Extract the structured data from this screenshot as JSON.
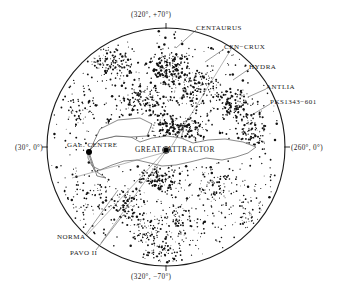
{
  "figure": {
    "type": "sky-map",
    "projection": "galactic-polar-disk",
    "background_color": "#ffffff",
    "point_color": "#111111",
    "outline_color": "#1a1a1a"
  },
  "axes": {
    "top_label": "(320°, +70°)",
    "bottom_label": "(320°, −70°)",
    "left_label": "(30°, 0°)",
    "right_label": "(260°, 0°)"
  },
  "features": {
    "centaurus": "CENTAURUS",
    "cen_crux": "CEN−CRUX",
    "hydra": "HYDRA",
    "antlia": "ANTLIA",
    "pks": "PKS1343−601",
    "gal_centre": "GAL. CENTRE",
    "great": "GREAT",
    "attractor": "ATTRACTOR",
    "norma": "NORMA",
    "pavo": "PAVO II"
  },
  "chart_data": {
    "type": "scatter",
    "title": "",
    "xlabel": "",
    "ylabel": "",
    "coordinate_system": "galactic",
    "disk": {
      "cx": 166,
      "cy": 147,
      "r": 119
    },
    "axis_ticks": [
      {
        "name": "top",
        "label": "(320°, +70°)",
        "x": 166,
        "y": 28
      },
      {
        "name": "bottom",
        "label": "(320°, −70°)",
        "x": 166,
        "y": 266
      },
      {
        "name": "left",
        "label": "(30°, 0°)",
        "x": 47,
        "y": 147
      },
      {
        "name": "right",
        "label": "(260°, 0°)",
        "x": 285,
        "y": 147
      }
    ],
    "marked_points": [
      {
        "name": "GAL. CENTRE",
        "x": 89,
        "y": 152,
        "size": 3.0
      },
      {
        "name": "PKS1343-601",
        "x": 166,
        "y": 150,
        "size": 2.6
      }
    ],
    "leader_lines": [
      {
        "name": "CENTAURUS",
        "x1": 196,
        "y1": 30,
        "x2": 176,
        "y2": 48
      },
      {
        "name": "CEN-CRUX",
        "x1": 224,
        "y1": 49,
        "x2": 205,
        "y2": 62
      },
      {
        "name": "HYDRA",
        "x1": 249,
        "y1": 69,
        "x2": 233,
        "y2": 80
      },
      {
        "name": "ANTLIA",
        "x1": 266,
        "y1": 89,
        "x2": 248,
        "y2": 97
      },
      {
        "name": "PKS1343-601",
        "x1": 270,
        "y1": 104,
        "x2": 250,
        "y2": 116
      },
      {
        "name": "NORMA",
        "x1": 86,
        "y1": 234,
        "x2": 118,
        "y2": 190
      },
      {
        "name": "PAVO II",
        "x1": 96,
        "y1": 250,
        "x2": 123,
        "y2": 215
      }
    ],
    "radial_lines": [
      {
        "name": "cen-crux-ray",
        "x1": 168,
        "y1": 152,
        "x2": 238,
        "y2": 38
      },
      {
        "name": "norma-ray",
        "x1": 166,
        "y1": 150,
        "x2": 86,
        "y2": 236
      },
      {
        "name": "pavo-ray",
        "x1": 166,
        "y1": 152,
        "x2": 101,
        "y2": 243
      },
      {
        "name": "gc-ray",
        "x1": 166,
        "y1": 152,
        "x2": 72,
        "y2": 178
      }
    ],
    "zone_of_avoidance": [
      [
        88,
        152
      ],
      [
        99,
        140
      ],
      [
        116,
        136
      ],
      [
        131,
        137
      ],
      [
        140,
        142
      ],
      [
        152,
        138
      ],
      [
        167,
        136
      ],
      [
        181,
        138
      ],
      [
        193,
        143
      ],
      [
        208,
        140
      ],
      [
        225,
        139
      ],
      [
        243,
        142
      ],
      [
        256,
        147
      ],
      [
        248,
        153
      ],
      [
        236,
        157
      ],
      [
        222,
        160
      ],
      [
        206,
        158
      ],
      [
        190,
        162
      ],
      [
        176,
        165
      ],
      [
        162,
        166
      ],
      [
        150,
        163
      ],
      [
        137,
        160
      ],
      [
        124,
        161
      ],
      [
        112,
        165
      ],
      [
        100,
        170
      ],
      [
        92,
        166
      ],
      [
        88,
        158
      ]
    ],
    "wedge_outline": [
      [
        89,
        152
      ],
      [
        100,
        129
      ],
      [
        118,
        120
      ],
      [
        140,
        118
      ],
      [
        152,
        124
      ],
      [
        147,
        136
      ],
      [
        131,
        137
      ],
      [
        116,
        136
      ],
      [
        99,
        140
      ],
      [
        88,
        152
      ],
      [
        94,
        170
      ],
      [
        106,
        178
      ],
      [
        97,
        176
      ]
    ],
    "cluster_seeds": [
      {
        "name": "centaurus-core",
        "cx": 168,
        "cy": 70,
        "rx": 24,
        "ry": 20,
        "n": 150,
        "size": 1.9
      },
      {
        "name": "centaurus-wing",
        "cx": 196,
        "cy": 86,
        "rx": 26,
        "ry": 22,
        "n": 130,
        "size": 1.8
      },
      {
        "name": "hydra-antlia",
        "cx": 232,
        "cy": 105,
        "rx": 24,
        "ry": 22,
        "n": 120,
        "size": 1.8
      },
      {
        "name": "great-attractor",
        "cx": 178,
        "cy": 128,
        "rx": 34,
        "ry": 16,
        "n": 175,
        "size": 1.9
      },
      {
        "name": "ga-south",
        "cx": 160,
        "cy": 178,
        "rx": 24,
        "ry": 14,
        "n": 110,
        "size": 1.8
      },
      {
        "name": "norma-filament",
        "cx": 127,
        "cy": 205,
        "rx": 20,
        "ry": 22,
        "n": 95,
        "size": 1.7
      },
      {
        "name": "pavo-filament",
        "cx": 148,
        "cy": 230,
        "rx": 20,
        "ry": 18,
        "n": 70,
        "size": 1.6
      },
      {
        "name": "upper-left-grp",
        "cx": 112,
        "cy": 62,
        "rx": 28,
        "ry": 24,
        "n": 120,
        "size": 1.7
      },
      {
        "name": "upper-mid-grp",
        "cx": 142,
        "cy": 100,
        "rx": 24,
        "ry": 20,
        "n": 110,
        "size": 1.7
      },
      {
        "name": "right-edge-grp",
        "cx": 252,
        "cy": 130,
        "rx": 18,
        "ry": 20,
        "n": 80,
        "size": 1.7
      },
      {
        "name": "lower-right-grp",
        "cx": 214,
        "cy": 190,
        "rx": 30,
        "ry": 26,
        "n": 95,
        "size": 1.6
      },
      {
        "name": "lower-mid-grp",
        "cx": 178,
        "cy": 225,
        "rx": 28,
        "ry": 22,
        "n": 85,
        "size": 1.6
      },
      {
        "name": "bottom-grp",
        "cx": 160,
        "cy": 252,
        "rx": 22,
        "ry": 12,
        "n": 55,
        "size": 1.6
      },
      {
        "name": "left-sparse",
        "cx": 85,
        "cy": 200,
        "rx": 26,
        "ry": 28,
        "n": 60,
        "size": 1.5
      },
      {
        "name": "left-upper",
        "cx": 78,
        "cy": 110,
        "rx": 22,
        "ry": 26,
        "n": 55,
        "size": 1.5
      },
      {
        "name": "right-lower",
        "cx": 248,
        "cy": 215,
        "rx": 20,
        "ry": 20,
        "n": 45,
        "size": 1.5
      }
    ],
    "field_points": 760,
    "density_note": "Dense supergalactic-plane clustering across the upper half; sparser south-west quadrant."
  }
}
